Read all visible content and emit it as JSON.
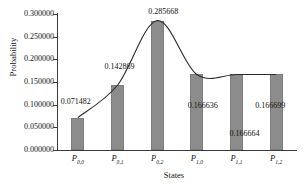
{
  "chart_data": {
    "type": "bar",
    "title": "",
    "xlabel": "States",
    "ylabel": "Probability",
    "categories": [
      "P_{0,0}",
      "P_{0,1}",
      "P_{0,2}",
      "P_{1,0}",
      "P_{1,1}",
      "P_{1,2}"
    ],
    "category_labels": [
      {
        "base": "P",
        "sub": "0,0"
      },
      {
        "base": "P",
        "sub": "0,1"
      },
      {
        "base": "P",
        "sub": "0,2"
      },
      {
        "base": "P",
        "sub": "1,0"
      },
      {
        "base": "P",
        "sub": "1,1"
      },
      {
        "base": "P",
        "sub": "1,2"
      }
    ],
    "values": [
      0.071482,
      0.142869,
      0.285668,
      0.166636,
      0.166664,
      0.166699
    ],
    "data_labels": [
      "0.071482",
      "0.142869",
      "0.285668",
      "0.166636",
      "0.166664",
      "0.166699"
    ],
    "ylim": [
      0.0,
      0.3
    ],
    "ytick_values": [
      0.3,
      0.25,
      0.2,
      0.15,
      0.1,
      0.05,
      0.0
    ],
    "ytick_labels": [
      "0.300000",
      "0.250000",
      "0.200000",
      "0.150000",
      "0.100000",
      "0.050000",
      "0.000000"
    ],
    "grid": true,
    "grid_style": "dotted",
    "legend": null,
    "bar_color": "#8c8c8c",
    "trendline": {
      "present": true,
      "style": "smooth-spline",
      "color": "#2b2b2b"
    }
  }
}
